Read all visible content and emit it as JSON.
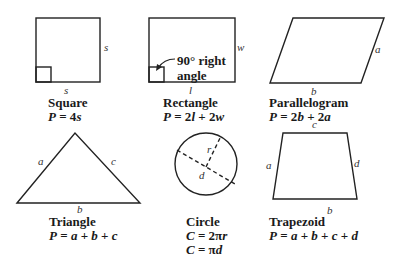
{
  "figure": {
    "shapes": [
      {
        "id": "square",
        "name": "Square",
        "formula": "P = 4s",
        "side_labels": {
          "right": "s",
          "bottom": "s"
        },
        "marker": "right-angle"
      },
      {
        "id": "rectangle",
        "name": "Rectangle",
        "formula": "P = 2l + 2w",
        "side_labels": {
          "right": "w",
          "bottom": "l"
        },
        "marker": "right-angle",
        "annotation": {
          "line1": "90° right",
          "line2": "angle"
        }
      },
      {
        "id": "parallelogram",
        "name": "Parallelogram",
        "formula": "P = 2b + 2a",
        "side_labels": {
          "right": "a",
          "bottom": "b"
        }
      },
      {
        "id": "triangle",
        "name": "Triangle",
        "formula": "P = a + b + c",
        "side_labels": {
          "left": "a",
          "right": "c",
          "bottom": "b"
        }
      },
      {
        "id": "circle",
        "name": "Circle",
        "formula": "C = 2πr",
        "formula2": "C = πd",
        "labels": {
          "radius": "r",
          "diameter": "d"
        }
      },
      {
        "id": "trapezoid",
        "name": "Trapezoid",
        "formula": "P = a + b + c + d",
        "side_labels": {
          "left": "a",
          "top": "c",
          "right": "d",
          "bottom": "b"
        }
      }
    ],
    "stroke_color": "#222222",
    "background": "#ffffff"
  }
}
